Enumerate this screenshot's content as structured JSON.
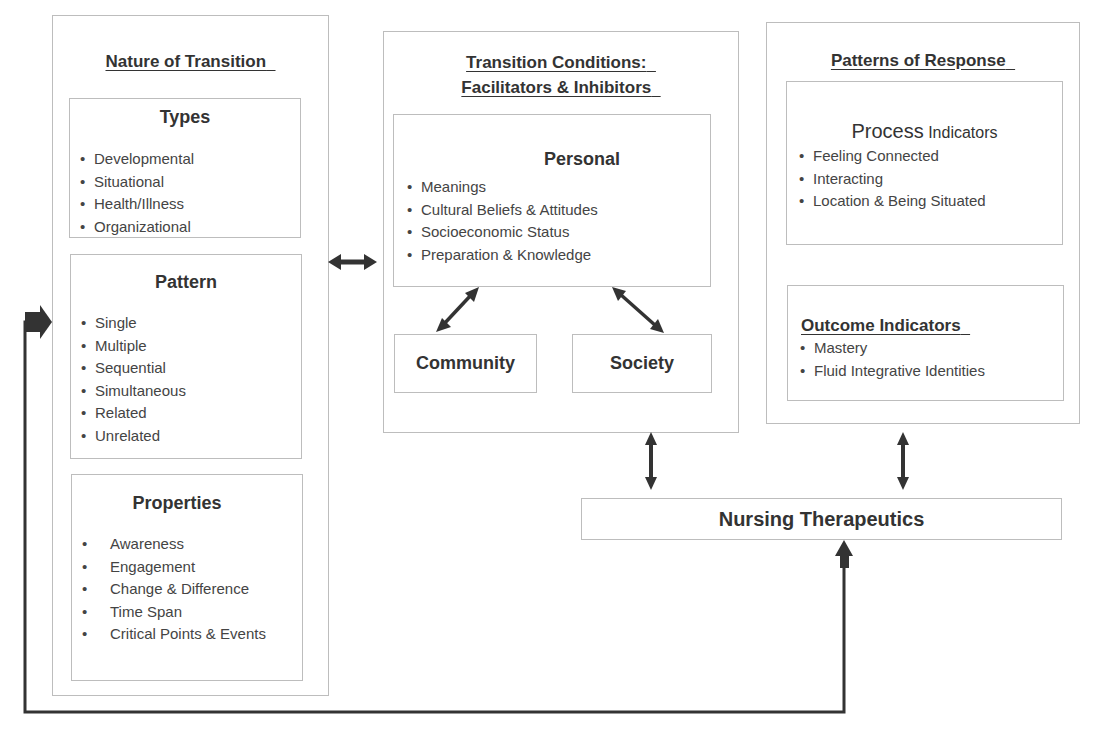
{
  "nature_of_transition": {
    "title": "Nature of Transition",
    "types": {
      "heading": "Types",
      "items": [
        "Developmental",
        "Situational",
        "Health/Illness",
        "Organizational"
      ]
    },
    "pattern": {
      "heading": "Pattern",
      "items": [
        "Single",
        "Multiple",
        "Sequential",
        "Simultaneous",
        "Related",
        "Unrelated"
      ]
    },
    "properties": {
      "heading": "Properties",
      "items": [
        "Awareness",
        "Engagement",
        "Change & Difference",
        "Time Span",
        "Critical Points & Events"
      ]
    }
  },
  "transition_conditions": {
    "title_line1": "Transition Conditions:",
    "title_line2": "Facilitators & Inhibitors",
    "personal": {
      "heading": "Personal",
      "items": [
        "Meanings",
        "Cultural Beliefs & Attitudes",
        "Socioeconomic Status",
        "Preparation & Knowledge"
      ]
    },
    "community": "Community",
    "society": "Society"
  },
  "patterns_of_response": {
    "title": "Patterns of Response",
    "process": {
      "heading_main": "Process",
      "heading_sub": "Indicators",
      "items": [
        "Feeling Connected",
        "Interacting",
        "Location & Being Situated"
      ]
    },
    "outcome": {
      "heading": "Outcome Indicators",
      "items": [
        "Mastery",
        "Fluid Integrative Identities"
      ]
    }
  },
  "nursing_therapeutics": "Nursing Therapeutics",
  "bullet": "•",
  "colors": {
    "arrow": "#333333",
    "border": "#bdbdbd",
    "text": "#333333"
  }
}
